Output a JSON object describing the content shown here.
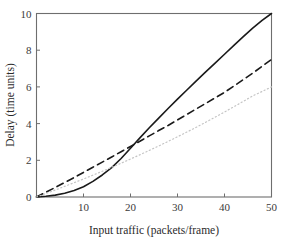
{
  "chart_data": {
    "type": "line",
    "title": "",
    "xlabel": "Input traffic (packets/frame)",
    "ylabel": "Delay (time units)",
    "xlim": [
      0,
      50
    ],
    "ylim": [
      0,
      10
    ],
    "xticks": [
      10,
      20,
      30,
      40,
      50
    ],
    "xticklabels": [
      "10",
      "20",
      "30",
      "40",
      "50"
    ],
    "yticks": [
      0,
      2,
      4,
      6,
      8,
      10
    ],
    "yticklabels": [
      "0",
      "2",
      "4",
      "6",
      "8",
      "10"
    ],
    "grid": false,
    "legend": "none",
    "frame": "box",
    "series": [
      {
        "name": "solid-curve",
        "style": "solid",
        "color": "#1a1a1a",
        "width": 1.6,
        "x": [
          0,
          2,
          4,
          6,
          8,
          10,
          12,
          14,
          16,
          18,
          20,
          22,
          24,
          26,
          28,
          30,
          32,
          34,
          36,
          38,
          40,
          42,
          44,
          46,
          48,
          50
        ],
        "y": [
          0.0,
          0.04,
          0.1,
          0.2,
          0.35,
          0.56,
          0.85,
          1.2,
          1.6,
          2.1,
          2.66,
          3.22,
          3.77,
          4.3,
          4.82,
          5.33,
          5.83,
          6.33,
          6.82,
          7.3,
          7.78,
          8.26,
          8.74,
          9.2,
          9.62,
          10.0
        ]
      },
      {
        "name": "dashed-curve",
        "style": "dashed",
        "color": "#1a1a1a",
        "width": 1.6,
        "x": [
          0,
          2,
          4,
          6,
          8,
          10,
          12,
          14,
          16,
          18,
          20,
          22,
          24,
          26,
          28,
          30,
          32,
          34,
          36,
          38,
          40,
          42,
          44,
          46,
          48,
          50
        ],
        "y": [
          0.0,
          0.26,
          0.52,
          0.79,
          1.06,
          1.34,
          1.62,
          1.9,
          2.18,
          2.47,
          2.75,
          3.04,
          3.33,
          3.62,
          3.9,
          4.2,
          4.5,
          4.8,
          5.1,
          5.4,
          5.7,
          6.05,
          6.4,
          6.75,
          7.12,
          7.5
        ]
      },
      {
        "name": "dotted-curve",
        "style": "dotted",
        "color": "#c4c4c4",
        "width": 1.2,
        "x": [
          0,
          2,
          4,
          6,
          8,
          10,
          12,
          14,
          16,
          18,
          20,
          22,
          24,
          26,
          28,
          30,
          32,
          34,
          36,
          38,
          40,
          42,
          44,
          46,
          48,
          50
        ],
        "y": [
          0.0,
          0.19,
          0.38,
          0.58,
          0.78,
          0.98,
          1.19,
          1.4,
          1.62,
          1.84,
          2.07,
          2.3,
          2.54,
          2.78,
          3.03,
          3.28,
          3.54,
          3.8,
          4.07,
          4.35,
          4.63,
          4.92,
          5.21,
          5.51,
          5.75,
          6.0
        ]
      }
    ]
  }
}
